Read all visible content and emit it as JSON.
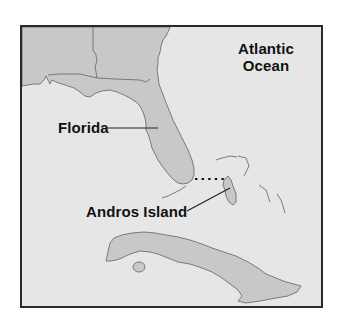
{
  "map": {
    "labels": {
      "ocean_line1": "Atlantic",
      "ocean_line2": "Ocean",
      "florida": "Florida",
      "andros": "Andros Island"
    },
    "colors": {
      "water": "#e6e6e6",
      "land": "#c8c8c8",
      "border": "#6e6e6e",
      "frame": "#2a2a2a",
      "leader": "#222222"
    }
  }
}
